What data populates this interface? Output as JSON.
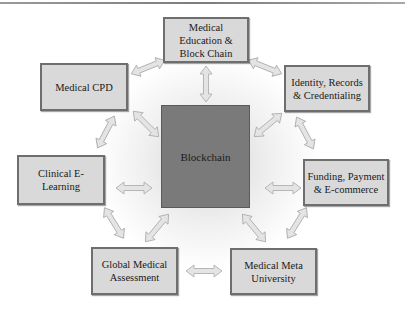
{
  "diagram": {
    "center": {
      "label": "Blockchain",
      "color": "#7a7a7a"
    },
    "nodes": [
      {
        "id": "medical-education",
        "label": "Medical\nEducation &\nBlock Chain"
      },
      {
        "id": "medical-cpd",
        "label": "Medical CPD"
      },
      {
        "id": "identity-records",
        "label": "Identity,  Records\n& Credentialing"
      },
      {
        "id": "clinical-elearning",
        "label": "Clinical E-\nLearning"
      },
      {
        "id": "funding-payment",
        "label": "Funding, Payment\n& E-commerce"
      },
      {
        "id": "global-assessment",
        "label": "Global Medical\nAssessment"
      },
      {
        "id": "meta-university",
        "label": "Medical Meta\nUniversity"
      }
    ],
    "node_fill": "#d9d9d9",
    "node_border": "#6e6e6e",
    "arrow_style": "double-headed"
  }
}
